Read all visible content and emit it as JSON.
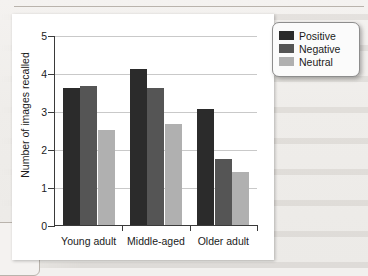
{
  "chart_data": {
    "type": "bar",
    "title": "",
    "xlabel": "",
    "ylabel": "Number of images recalled",
    "categories": [
      "Young adult",
      "Middle-aged",
      "Older adult"
    ],
    "series": [
      {
        "name": "Positive",
        "color": "#2b2b2b",
        "values": [
          3.6,
          4.1,
          3.05
        ]
      },
      {
        "name": "Negative",
        "color": "#555555",
        "values": [
          3.65,
          3.6,
          1.75
        ]
      },
      {
        "name": "Neutral",
        "color": "#b0b0b0",
        "values": [
          2.5,
          2.65,
          1.4
        ]
      }
    ],
    "ylim": [
      0,
      5
    ],
    "yticks": [
      0,
      1,
      2,
      3,
      4,
      5
    ],
    "ytick_labels": [
      "0",
      "1",
      "2",
      "3",
      "4",
      "5"
    ],
    "grid": true,
    "legend_position": "right-outside"
  },
  "legend": {
    "items": [
      {
        "label": "Positive"
      },
      {
        "label": "Negative"
      },
      {
        "label": "Neutral"
      }
    ]
  }
}
